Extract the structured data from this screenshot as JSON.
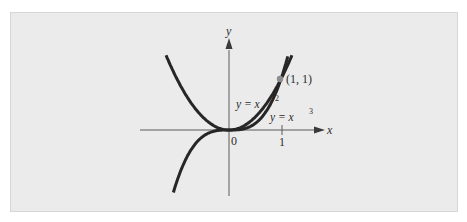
{
  "figure": {
    "background_color": "#ebebeb",
    "curve_color": "#262626",
    "point_color": "#8c8c8c",
    "axes": {
      "x_label": "x",
      "y_label": "y",
      "origin_label": "0",
      "x_tick_label": "1"
    },
    "curves": [
      {
        "name": "parabola",
        "label_lhs": "y = x",
        "exponent": "2"
      },
      {
        "name": "cubic",
        "label_lhs": "y = x",
        "exponent": "3"
      }
    ],
    "point": {
      "label": "(1, 1)"
    }
  },
  "chart_data": {
    "type": "line",
    "title": "",
    "xlabel": "x",
    "ylabel": "y",
    "series": [
      {
        "name": "y = x^2",
        "x": [
          -1.2,
          -1,
          -0.5,
          0,
          0.5,
          1,
          1.2
        ],
        "y": [
          1.44,
          1,
          0.25,
          0,
          0.25,
          1,
          1.44
        ]
      },
      {
        "name": "y = x^3",
        "x": [
          -1.07,
          -1,
          -0.5,
          0,
          0.5,
          1,
          1.13
        ],
        "y": [
          -1.23,
          -1,
          -0.125,
          0,
          0.125,
          1,
          1.44
        ]
      }
    ],
    "annotations": [
      {
        "x": 1,
        "y": 1,
        "text": "(1, 1)"
      }
    ],
    "ticks": {
      "x": [
        "0",
        "1"
      ]
    },
    "grid": false
  }
}
